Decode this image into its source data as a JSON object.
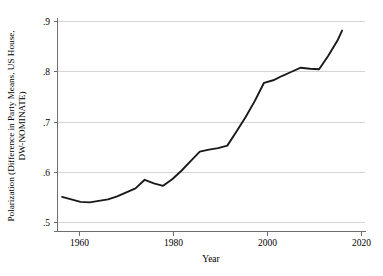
{
  "chart_data": {
    "type": "line",
    "title": "",
    "xlabel": "Year",
    "ylabel": "Polarization (Difference in Party Means, US House, DW-NOMINATE)",
    "ylabel_lines": [
      "Polarization (Difference in Party Means, US House,",
      "DW-NOMINATE)"
    ],
    "xlim": [
      1954,
      2021
    ],
    "ylim": [
      0.5,
      0.9
    ],
    "xticks": [
      1960,
      1980,
      2000,
      2020
    ],
    "xtick_labels": [
      "1960",
      "1980",
      "2000",
      "2020"
    ],
    "yticks": [
      0.5,
      0.6,
      0.7,
      0.8,
      0.9
    ],
    "ytick_labels": [
      ".5",
      ".6",
      ".7",
      ".8",
      ".9"
    ],
    "grid": "horizontal",
    "legend": "none",
    "line_color": "#1a1a1a",
    "grid_color": "#c9c9c9",
    "axis_color": "#6f6f6f",
    "background_color": "#ffffff",
    "x": [
      1955,
      1957,
      1959,
      1961,
      1963,
      1965,
      1967,
      1969,
      1971,
      1973,
      1975,
      1977,
      1979,
      1981,
      1983,
      1985,
      1987,
      1989,
      1991,
      1993,
      1995,
      1997,
      1999,
      2001,
      2003,
      2005,
      2007,
      2009,
      2011,
      2013,
      2015
    ],
    "values": [
      0.551,
      0.546,
      0.541,
      0.54,
      0.543,
      0.546,
      0.552,
      0.56,
      0.568,
      0.585,
      0.578,
      0.573,
      0.586,
      0.603,
      0.622,
      0.641,
      0.645,
      0.648,
      0.653,
      0.681,
      0.71,
      0.742,
      0.778,
      0.783,
      0.792,
      0.8,
      0.808,
      0.806,
      0.805,
      0.832,
      0.862
    ],
    "series": [
      {
        "name": "Polarization (DW-NOMINATE)",
        "x": [
          1955,
          1957,
          1959,
          1961,
          1963,
          1965,
          1967,
          1969,
          1971,
          1973,
          1975,
          1977,
          1979,
          1981,
          1983,
          1985,
          1987,
          1989,
          1991,
          1993,
          1995,
          1997,
          1999,
          2001,
          2003,
          2005,
          2007,
          2009,
          2011,
          2013,
          2015,
          2016
        ],
        "values": [
          0.551,
          0.546,
          0.541,
          0.54,
          0.543,
          0.546,
          0.552,
          0.56,
          0.568,
          0.585,
          0.578,
          0.573,
          0.586,
          0.603,
          0.622,
          0.641,
          0.645,
          0.648,
          0.653,
          0.681,
          0.71,
          0.742,
          0.778,
          0.783,
          0.792,
          0.8,
          0.808,
          0.806,
          0.805,
          0.832,
          0.862,
          0.882
        ]
      }
    ]
  }
}
